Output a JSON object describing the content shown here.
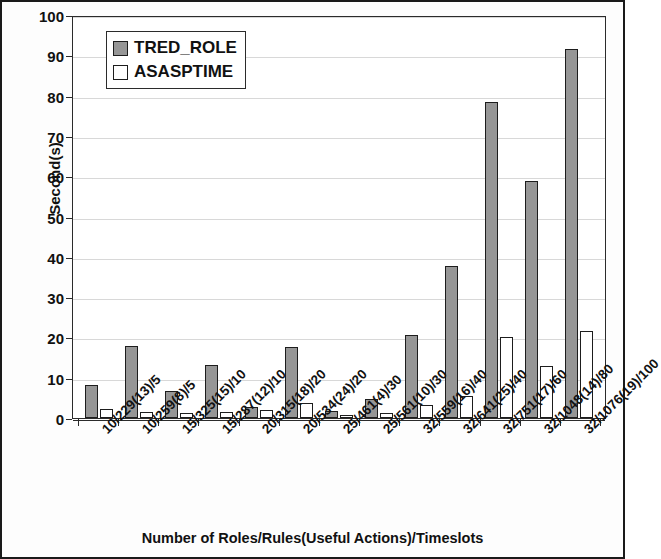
{
  "chart_data": {
    "type": "bar",
    "title": "",
    "xlabel": "Number of Roles/Rules(Useful Actions)/Timeslots",
    "ylabel": "Second(s)",
    "ylim": [
      0,
      100
    ],
    "yticks": [
      0,
      10,
      20,
      30,
      40,
      50,
      60,
      70,
      80,
      90,
      100
    ],
    "grid": true,
    "legend_position": "top-left",
    "categories": [
      "10/229(13)/5",
      "10/259(8)/5",
      "15/325(15)/10",
      "15/287(12)/10",
      "20/315(18)/20",
      "20/534(24)/20",
      "25/461(4)/30",
      "25/561(10)/30",
      "32/559(16)/40",
      "32/641(25)/40",
      "32/751(17)/60",
      "32/1048(14)/80",
      "32/1076(19)/100"
    ],
    "series": [
      {
        "name": "TRED_ROLE",
        "color": "#969696",
        "values": [
          8.3,
          17.8,
          6.6,
          13.1,
          2.8,
          17.5,
          1.8,
          4.6,
          20.7,
          37.6,
          78.4,
          58.8,
          91.5
        ]
      },
      {
        "name": "ASASPTIME",
        "color": "#ffffff",
        "values": [
          2.2,
          1.4,
          1.2,
          1.4,
          2.0,
          3.7,
          0.8,
          1.3,
          3.3,
          5.4,
          20.2,
          13.0,
          21.6
        ]
      }
    ]
  }
}
